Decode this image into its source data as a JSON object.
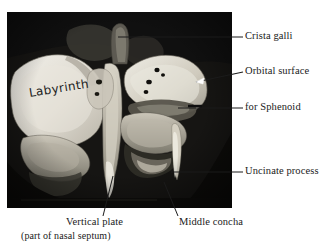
{
  "figure": {
    "kind": "anatomical-photograph",
    "background_color": "#ffffff",
    "photo_background_color": "#0b0b0b",
    "text_color": "#1a1a1a"
  },
  "specimen_annotation": {
    "label": "Labyrinth"
  },
  "callouts": {
    "crista_galli": "Crista galli",
    "orbital_surface": "Orbital surface",
    "for_sphenoid": "for Sphenoid",
    "uncinate_process": "Uncinate process",
    "vertical_plate": "Vertical plate",
    "vertical_plate_sub": "(part of nasal septum)",
    "middle_concha": "Middle concha"
  }
}
